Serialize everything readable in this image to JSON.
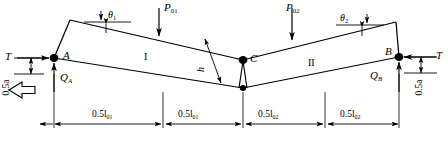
{
  "figure": {
    "type": "structural-engineering-diagram",
    "background_color": "#ffffff",
    "line_color": "#000000"
  },
  "nodes": [
    {
      "id": "node-a",
      "label": "A",
      "x": 54,
      "y": 58
    },
    {
      "id": "node-c",
      "label": "C",
      "x": 243,
      "y": 60
    },
    {
      "id": "node-b",
      "label": "B",
      "x": 399,
      "y": 57
    }
  ],
  "segments": [
    {
      "id": "segment-1",
      "label": "I",
      "x": 144,
      "y": 57
    },
    {
      "id": "segment-2",
      "label": "II",
      "x": 310,
      "y": 62
    }
  ],
  "loads": [
    {
      "id": "load-p01",
      "base": "P",
      "sub": "01",
      "x": 163,
      "y": 3
    },
    {
      "id": "load-p02",
      "base": "P",
      "sub": "02",
      "x": 285,
      "y": 3
    }
  ],
  "tensions": [
    {
      "id": "tension-left",
      "label": "T",
      "x": 7,
      "y": 52
    },
    {
      "id": "tension-right",
      "label": "T",
      "x": 433,
      "y": 51
    }
  ],
  "reactions": [
    {
      "id": "reaction-qa",
      "base": "Q",
      "sub": "A",
      "x": 62,
      "y": 72
    },
    {
      "id": "reaction-qb",
      "base": "Q",
      "sub": "B",
      "x": 372,
      "y": 70
    }
  ],
  "angles": [
    {
      "id": "angle-theta1",
      "base": "θ",
      "sub": "1",
      "x": 106,
      "y": 9
    },
    {
      "id": "angle-theta2",
      "base": "θ",
      "sub": "2",
      "x": 340,
      "y": 13
    }
  ],
  "sag": {
    "id": "sag-height",
    "label": "h",
    "x": 213,
    "y": 54
  },
  "end_offsets": [
    {
      "id": "offset-left",
      "label": "0.5a",
      "x": 10,
      "y": 92
    },
    {
      "id": "offset-right",
      "label": "0.5a",
      "x": 423,
      "y": 92
    }
  ],
  "dimensions": [
    {
      "id": "dim-1",
      "base": "0.5l",
      "sub": "01",
      "x": 97,
      "y": 110,
      "start_x": 60,
      "end_x": 160
    },
    {
      "id": "dim-2",
      "base": "0.5l",
      "sub": "01",
      "x": 180,
      "y": 110,
      "start_x": 166,
      "end_x": 242
    },
    {
      "id": "dim-3",
      "base": "0.5l",
      "sub": "02",
      "x": 258,
      "y": 110,
      "start_x": 248,
      "end_x": 322
    },
    {
      "id": "dim-4",
      "base": "0.5l",
      "sub": "02",
      "x": 342,
      "y": 110,
      "start_x": 328,
      "end_x": 404
    }
  ],
  "arrow_block": {
    "id": "direction-arrow",
    "label": "",
    "x": 18,
    "y": 86,
    "direction": "left"
  },
  "geometry": {
    "top_chord_left": [
      [
        70,
        20
      ],
      [
        243,
        60
      ]
    ],
    "top_chord_right": [
      [
        243,
        60
      ],
      [
        396,
        22
      ]
    ],
    "bottom_chord_left": [
      [
        54,
        58
      ],
      [
        243,
        88
      ]
    ],
    "bottom_chord_right": [
      [
        243,
        88
      ],
      [
        399,
        57
      ]
    ],
    "left_riser": [
      [
        70,
        20
      ],
      [
        54,
        58
      ]
    ],
    "right_riser": [
      [
        396,
        22
      ],
      [
        399,
        57
      ]
    ]
  }
}
